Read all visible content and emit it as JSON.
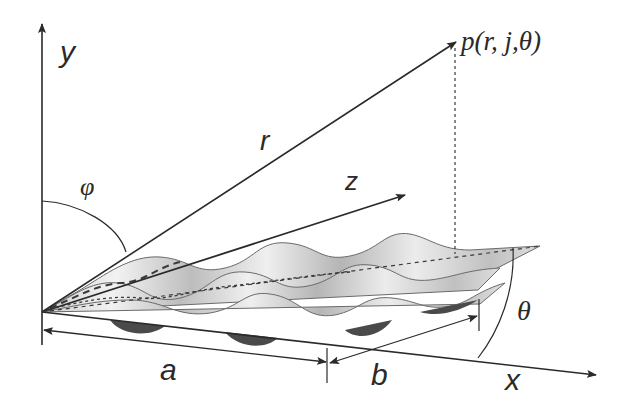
{
  "diagram": {
    "labels": {
      "y_axis": "y",
      "x_axis": "x",
      "z_axis": "z",
      "radius": "r",
      "phi": "φ",
      "theta": "θ",
      "point": "p(r, j,θ)",
      "dim_a": "a",
      "dim_b": "b"
    },
    "colors": {
      "line": "#2a2a2a",
      "surface_light": "#e6e6e6",
      "surface_mid": "#b8b8b8",
      "surface_dark": "#4a4a4a",
      "background": "#ffffff"
    },
    "surface": {
      "ridges": 3,
      "periods_per_ridge": 3
    }
  }
}
